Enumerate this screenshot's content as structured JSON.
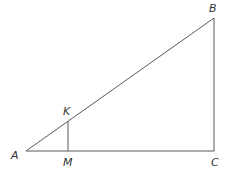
{
  "diagram": {
    "type": "geometry",
    "points": {
      "A": {
        "label": "A",
        "x": 26,
        "y": 151,
        "label_x": 11,
        "label_y": 159
      },
      "B": {
        "label": "B",
        "x": 214,
        "y": 18,
        "label_x": 209,
        "label_y": 12
      },
      "C": {
        "label": "C",
        "x": 214,
        "y": 151,
        "label_x": 211,
        "label_y": 166
      },
      "K": {
        "label": "K",
        "x": 68,
        "y": 121,
        "label_x": 63,
        "label_y": 115
      },
      "M": {
        "label": "M",
        "x": 68,
        "y": 151,
        "label_x": 63,
        "label_y": 166
      }
    },
    "segments": [
      {
        "name": "AB",
        "from": "A",
        "to": "B"
      },
      {
        "name": "BC",
        "from": "B",
        "to": "C"
      },
      {
        "name": "AC",
        "from": "A",
        "to": "C"
      },
      {
        "name": "KM",
        "from": "K",
        "to": "M"
      }
    ],
    "line_color": "#5a5a5a"
  }
}
